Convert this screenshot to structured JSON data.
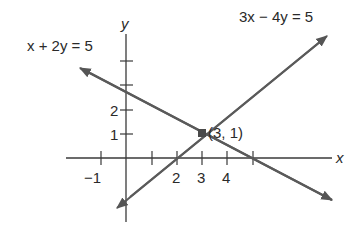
{
  "diagram": {
    "line_color": "#5a5a5a",
    "axis_color": "#3a3a3a",
    "point_color": "#4a4a4a",
    "axes": {
      "x_label": "x",
      "y_label": "y",
      "x_tick_labels": [
        "−1",
        "2",
        "3",
        "4"
      ],
      "y_tick_labels": [
        "1",
        "2",
        "5"
      ]
    },
    "equations": [
      {
        "label": "x + 2y = 5",
        "slope": -0.5,
        "y_intercept": 2.5
      },
      {
        "label": "3x − 4y = 5",
        "slope": 0.75,
        "y_intercept": -1.25
      }
    ],
    "intersection": {
      "label": "(3, 1)",
      "x": 3,
      "y": 1
    }
  }
}
